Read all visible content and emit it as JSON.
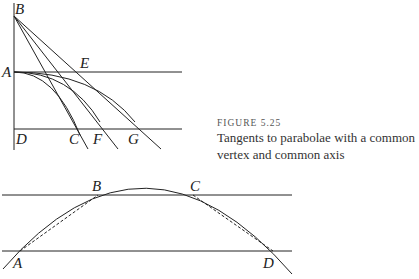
{
  "caption": {
    "figure_number": "FIGURE 5.25",
    "text": "Tangents to parabolae with a common vertex and common axis"
  },
  "top_figure": {
    "labels": {
      "B": "B",
      "A": "A",
      "E": "E",
      "D": "D",
      "C": "C",
      "F": "F",
      "G": "G"
    }
  },
  "bottom_figure": {
    "labels": {
      "A": "A",
      "B": "B",
      "C": "C",
      "D": "D"
    }
  },
  "colors": {
    "line": "#222222",
    "caption": "#333333"
  }
}
